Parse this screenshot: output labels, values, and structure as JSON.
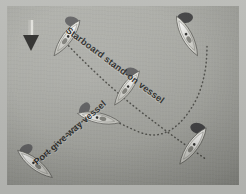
{
  "diagram": {
    "background_color": "#a3a49e",
    "border_color": "#b9bab6",
    "labels": [
      {
        "id": "starboard",
        "text": "Starboard stand-on vessel",
        "rotation_deg": 37,
        "color": "#2e2e2c"
      },
      {
        "id": "port",
        "text": "Port give-way vessel",
        "rotation_deg": -41,
        "color": "#2e2e2c"
      }
    ],
    "wind_arrow": {
      "name": "wind-direction-arrow",
      "direction": "down",
      "color": "#3a3a38",
      "x": 24,
      "y": 14
    },
    "tracks": [
      {
        "id": "starboard-track",
        "name": "starboard-vessel-track",
        "style": "dotted",
        "color": "#4a4a46",
        "path": "M 56 34 C 90 70, 120 96, 150 118 C 168 132, 186 144, 200 154"
      },
      {
        "id": "port-track",
        "name": "port-vessel-track",
        "style": "dotted",
        "color": "#4a4a46",
        "path": "M 34 154 C 52 136, 62 122, 78 114 C 96 106, 112 118, 132 126 C 156 136, 176 120, 190 92 C 198 74, 200 56, 200 40"
      }
    ],
    "vessels": [
      {
        "id": "stbd-1",
        "name": "sailboat-starboard-position-1",
        "x": 60,
        "y": 32,
        "rotation_deg": 36,
        "scale": 1.0,
        "sail_color": "#58585a",
        "hull_color": "#d8d8d2"
      },
      {
        "id": "stbd-2",
        "name": "sailboat-starboard-position-2",
        "x": 120,
        "y": 82,
        "rotation_deg": 36,
        "scale": 0.96,
        "sail_color": "#58585a",
        "hull_color": "#d8d8d2"
      },
      {
        "id": "stbd-3",
        "name": "sailboat-starboard-position-3",
        "x": 186,
        "y": 140,
        "rotation_deg": 36,
        "scale": 1.02,
        "sail_color": "#3b3b3d",
        "hull_color": "#d8d8d2"
      },
      {
        "id": "port-1",
        "name": "sailboat-port-position-1",
        "x": 28,
        "y": 158,
        "rotation_deg": -52,
        "scale": 1.0,
        "sail_color": "#58585a",
        "hull_color": "#dcdcd6"
      },
      {
        "id": "port-2",
        "name": "sailboat-port-position-2",
        "x": 92,
        "y": 112,
        "rotation_deg": -78,
        "scale": 1.0,
        "sail_color": "#58585a",
        "hull_color": "#dcdcd6"
      },
      {
        "id": "port-3",
        "name": "sailboat-port-position-3",
        "x": 180,
        "y": 30,
        "rotation_deg": -28,
        "scale": 1.02,
        "sail_color": "#3b3b3d",
        "hull_color": "#dcdcd6"
      }
    ]
  }
}
